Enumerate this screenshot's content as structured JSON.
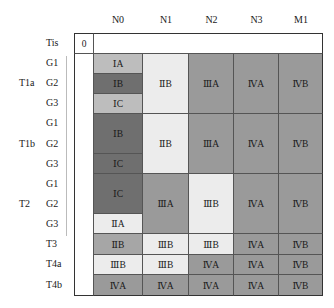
{
  "columns": [
    "N0",
    "N1",
    "N2",
    "N3",
    "M1"
  ],
  "tis": {
    "label": "Tis",
    "value": "0"
  },
  "groups": [
    {
      "label": "T1a",
      "rows": [
        "G1",
        "G2",
        "G3"
      ]
    },
    {
      "label": "T1b",
      "rows": [
        "G1",
        "G2",
        "G3"
      ]
    },
    {
      "label": "T2",
      "rows": [
        "G1",
        "G2",
        "G3"
      ]
    }
  ],
  "single_rows": [
    "T3",
    "T4a",
    "T4b"
  ],
  "cells": {
    "t1a_g1_n0": "ⅠA",
    "t1a_g2_n0": "ⅠB",
    "t1a_g3_n0": "ⅠC",
    "t1a_n1": "ⅡB",
    "t1a_n2": "ⅢA",
    "t1a_n3": "ⅣA",
    "t1a_m1": "ⅣB",
    "t1b_g12_n0": "ⅠB",
    "t1b_g3_n0": "ⅠC",
    "t1b_n1": "ⅡB",
    "t1b_n2": "ⅢA",
    "t1b_n3": "ⅣA",
    "t1b_m1": "ⅣB",
    "t2_g12_n0": "ⅠC",
    "t2_g3_n0": "ⅡA",
    "t2_n1": "ⅢA",
    "t2_n2": "ⅢB",
    "t2_n3": "ⅣA",
    "t2_m1": "ⅣB",
    "t3": [
      "ⅡB",
      "ⅢB",
      "ⅢB",
      "ⅣA",
      "ⅣB"
    ],
    "t4a": [
      "ⅢB",
      "ⅢB",
      "ⅣA",
      "ⅣA",
      "ⅣB"
    ],
    "t4b": [
      "ⅣA",
      "ⅣA",
      "ⅣA",
      "ⅣA",
      "ⅣB"
    ]
  },
  "colors": {
    "light": "#ececec",
    "light_mid": "#bdbdbd",
    "mid": "#9a9a9a",
    "dark": "#6f6f6f"
  }
}
